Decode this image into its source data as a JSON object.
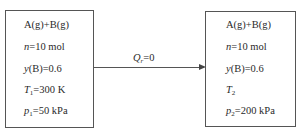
{
  "diagram": {
    "initial_state": {
      "system": "A(g)+B(g)",
      "n": {
        "symbol": "n",
        "value": "=10 mol"
      },
      "yB": {
        "symbol": "y",
        "value": "(B)=0.6"
      },
      "T": {
        "symbol": "T",
        "sub": "1",
        "value": "=300 K"
      },
      "p": {
        "symbol": "p",
        "sub": "1",
        "value": "=50 kPa"
      }
    },
    "process": {
      "symbol": "Q",
      "sub": "r",
      "value": "=0"
    },
    "final_state": {
      "system": "A(g)+B(g)",
      "n": {
        "symbol": "n",
        "value": "=10 mol"
      },
      "yB": {
        "symbol": "y",
        "value": "(B)=0.6"
      },
      "T": {
        "symbol": "T",
        "sub": "2",
        "value": ""
      },
      "p": {
        "symbol": "p",
        "sub": "2",
        "value": "=200 kPa"
      }
    },
    "colors": {
      "line": "#555555",
      "text": "#2a2a2a",
      "background": "#ffffff"
    }
  }
}
